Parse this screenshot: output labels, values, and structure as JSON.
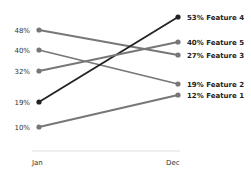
{
  "chart_data": {
    "type": "line",
    "subtype": "slope",
    "title": "",
    "xlabel": "",
    "ylabel": "",
    "categories": [
      "Jan",
      "Dec"
    ],
    "series": [
      {
        "name": "Feature 1",
        "values": [
          10,
          12
        ],
        "color": "#777777",
        "start_label": "10%",
        "end_label": "12% Feature 1"
      },
      {
        "name": "Feature 2",
        "values": [
          40,
          19
        ],
        "color": "#777777",
        "start_label": "40%",
        "end_label": "19% Feature 2"
      },
      {
        "name": "Feature 3",
        "values": [
          48,
          27
        ],
        "color": "#777777",
        "start_label": "48%",
        "end_label": "27% Feature 3"
      },
      {
        "name": "Feature 4",
        "values": [
          19,
          53
        ],
        "color": "#222222",
        "start_label": "19%",
        "end_label": "53% Feature 4"
      },
      {
        "name": "Feature 5",
        "values": [
          32,
          40
        ],
        "color": "#777777",
        "start_label": "32%",
        "end_label": "40% Feature 5"
      }
    ],
    "grid": false,
    "legend": "direct labels at line ends"
  },
  "axis": {
    "left_label": "Jan",
    "right_label": "Dec"
  }
}
